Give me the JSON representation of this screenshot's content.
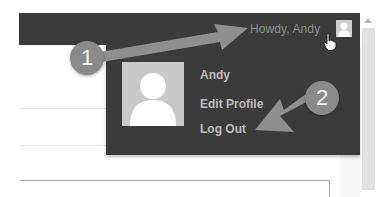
{
  "admin_bar": {
    "greeting": "Howdy, Andy",
    "avatar_icon": "user-avatar-icon",
    "background_color": "#3b3b3b"
  },
  "user_menu": {
    "avatar_icon": "user-avatar-icon",
    "items": [
      {
        "label": "Andy"
      },
      {
        "label": "Edit Profile"
      },
      {
        "label": "Log Out"
      }
    ]
  },
  "annotations": {
    "badges": [
      {
        "label": "1",
        "points_to": "Howdy, Andy"
      },
      {
        "label": "2",
        "points_to": "Log Out"
      }
    ],
    "color": "#8a8a8a"
  },
  "cursor": {
    "icon": "hand-pointer-icon"
  }
}
